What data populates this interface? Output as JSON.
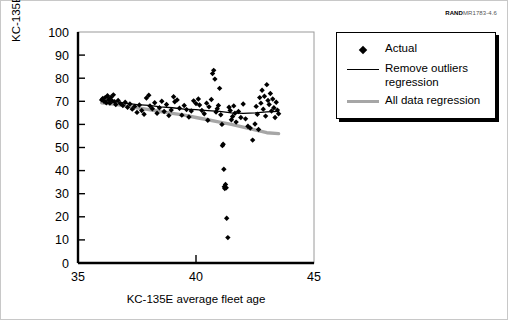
{
  "figure": {
    "source_code_bold": "RAND",
    "source_code_rest": "MR1783-4.6"
  },
  "legend": {
    "items": [
      {
        "key": "diamond-marker",
        "label": "Actual"
      },
      {
        "key": "thin-black-line",
        "label": "Remove outliers regression"
      },
      {
        "key": "thick-gray-line",
        "label": "All data regression"
      }
    ],
    "item_actual": "Actual",
    "item_remove_outliers_line1": "Remove outliers",
    "item_remove_outliers_line2": "regression",
    "item_all_data": "All data regression"
  },
  "colors": {
    "marker": "#000000",
    "remove_outliers_line": "#000000",
    "all_data_line": "#a6a6a6",
    "axis": "#000000",
    "background": "#ffffff"
  },
  "chart_data": {
    "type": "scatter",
    "title": "",
    "xlabel": "KC-135E average fleet age",
    "ylabel": "KC-135E fully mission capable rate",
    "xlim": [
      35,
      45
    ],
    "ylim": [
      0,
      100
    ],
    "xticks": [
      35,
      40,
      45
    ],
    "yticks": [
      0,
      10,
      20,
      30,
      40,
      50,
      60,
      70,
      80,
      90,
      100
    ],
    "grid": false,
    "legend_position": "right-outside",
    "series": [
      {
        "name": "Actual",
        "type": "scatter",
        "marker": "diamond",
        "points": [
          [
            36.0,
            70.6
          ],
          [
            36.05,
            71.2
          ],
          [
            36.1,
            70.0
          ],
          [
            36.15,
            71.6
          ],
          [
            36.2,
            69.4
          ],
          [
            36.25,
            72.4
          ],
          [
            36.3,
            70.8
          ],
          [
            36.35,
            69.2
          ],
          [
            36.4,
            71.8
          ],
          [
            36.45,
            70.2
          ],
          [
            36.5,
            72.8
          ],
          [
            36.55,
            69.8
          ],
          [
            36.6,
            68.6
          ],
          [
            36.7,
            70.4
          ],
          [
            36.8,
            69.0
          ],
          [
            36.9,
            68.2
          ],
          [
            37.0,
            69.6
          ],
          [
            37.1,
            67.4
          ],
          [
            37.2,
            68.8
          ],
          [
            37.3,
            66.6
          ],
          [
            37.4,
            67.8
          ],
          [
            37.5,
            65.2
          ],
          [
            37.6,
            68.4
          ],
          [
            37.7,
            66.0
          ],
          [
            37.8,
            64.4
          ],
          [
            37.9,
            71.4
          ],
          [
            38.0,
            72.6
          ],
          [
            38.05,
            68.0
          ],
          [
            38.15,
            66.8
          ],
          [
            38.25,
            69.4
          ],
          [
            38.35,
            64.8
          ],
          [
            38.45,
            67.2
          ],
          [
            38.55,
            70.0
          ],
          [
            38.65,
            65.6
          ],
          [
            38.75,
            68.6
          ],
          [
            38.85,
            63.8
          ],
          [
            38.95,
            66.2
          ],
          [
            39.05,
            72.0
          ],
          [
            39.1,
            69.8
          ],
          [
            39.2,
            70.6
          ],
          [
            39.3,
            67.0
          ],
          [
            39.4,
            64.0
          ],
          [
            39.5,
            68.2
          ],
          [
            39.6,
            66.4
          ],
          [
            39.7,
            63.2
          ],
          [
            39.8,
            65.8
          ],
          [
            39.9,
            70.2
          ],
          [
            40.0,
            69.0
          ],
          [
            40.1,
            71.0
          ],
          [
            40.15,
            68.4
          ],
          [
            40.25,
            66.0
          ],
          [
            40.35,
            64.6
          ],
          [
            40.45,
            69.2
          ],
          [
            40.5,
            61.8
          ],
          [
            40.55,
            67.6
          ],
          [
            40.65,
            70.8
          ],
          [
            40.7,
            82.0
          ],
          [
            40.75,
            83.4
          ],
          [
            40.8,
            79.6
          ],
          [
            40.85,
            65.4
          ],
          [
            40.9,
            66.8
          ],
          [
            40.95,
            68.2
          ],
          [
            41.0,
            75.6
          ],
          [
            41.05,
            64.2
          ],
          [
            41.1,
            60.0
          ],
          [
            41.12,
            50.8
          ],
          [
            41.15,
            51.4
          ],
          [
            41.18,
            40.6
          ],
          [
            41.2,
            33.0
          ],
          [
            41.22,
            32.2
          ],
          [
            41.25,
            34.0
          ],
          [
            41.28,
            32.6
          ],
          [
            41.3,
            19.4
          ],
          [
            41.35,
            11.0
          ],
          [
            41.4,
            67.4
          ],
          [
            41.45,
            66.0
          ],
          [
            41.5,
            62.0
          ],
          [
            41.55,
            63.4
          ],
          [
            41.6,
            68.0
          ],
          [
            41.65,
            64.8
          ],
          [
            41.7,
            61.0
          ],
          [
            41.8,
            65.6
          ],
          [
            41.9,
            63.0
          ],
          [
            42.0,
            68.8
          ],
          [
            42.1,
            62.4
          ],
          [
            42.2,
            59.2
          ],
          [
            42.3,
            58.4
          ],
          [
            42.4,
            53.2
          ],
          [
            42.5,
            60.2
          ],
          [
            42.55,
            67.8
          ],
          [
            42.6,
            64.4
          ],
          [
            42.65,
            57.8
          ],
          [
            42.7,
            71.6
          ],
          [
            42.75,
            69.2
          ],
          [
            42.8,
            74.8
          ],
          [
            42.85,
            66.6
          ],
          [
            42.9,
            72.2
          ],
          [
            42.95,
            63.6
          ],
          [
            43.0,
            77.2
          ],
          [
            43.05,
            70.4
          ],
          [
            43.1,
            68.6
          ],
          [
            43.15,
            73.4
          ],
          [
            43.2,
            65.8
          ],
          [
            43.25,
            71.0
          ],
          [
            43.3,
            67.2
          ],
          [
            43.35,
            63.0
          ],
          [
            43.4,
            69.6
          ],
          [
            43.45,
            66.2
          ],
          [
            43.5,
            64.6
          ]
        ]
      },
      {
        "name": "Remove outliers regression",
        "type": "line",
        "style": "thin-black",
        "points": [
          [
            36.0,
            70.4
          ],
          [
            36.5,
            70.0
          ],
          [
            37.0,
            69.2
          ],
          [
            37.5,
            68.6
          ],
          [
            38.0,
            68.2
          ],
          [
            38.5,
            67.6
          ],
          [
            39.0,
            67.2
          ],
          [
            39.5,
            66.6
          ],
          [
            40.0,
            66.4
          ],
          [
            40.5,
            66.0
          ],
          [
            41.0,
            65.6
          ],
          [
            41.5,
            65.0
          ],
          [
            42.0,
            64.8
          ],
          [
            42.5,
            65.0
          ],
          [
            43.0,
            65.4
          ],
          [
            43.5,
            65.6
          ]
        ]
      },
      {
        "name": "All data regression",
        "type": "line",
        "style": "thick-gray",
        "points": [
          [
            36.0,
            69.4
          ],
          [
            36.5,
            68.8
          ],
          [
            37.0,
            68.0
          ],
          [
            37.5,
            67.2
          ],
          [
            38.0,
            66.4
          ],
          [
            38.5,
            65.6
          ],
          [
            39.0,
            64.8
          ],
          [
            39.5,
            64.0
          ],
          [
            40.0,
            63.0
          ],
          [
            40.5,
            62.0
          ],
          [
            41.0,
            61.0
          ],
          [
            41.5,
            60.0
          ],
          [
            42.0,
            58.8
          ],
          [
            42.5,
            57.6
          ],
          [
            43.0,
            56.4
          ],
          [
            43.5,
            56.0
          ]
        ]
      }
    ]
  }
}
